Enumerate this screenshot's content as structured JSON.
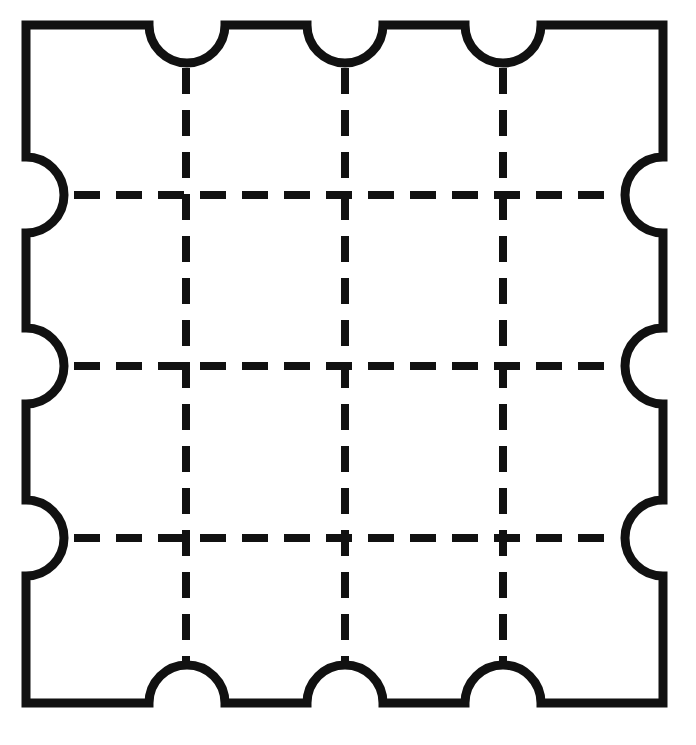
{
  "figure": {
    "title": "Square puzzle tile outline with notched edges and dashed grid",
    "caption": "",
    "background_color": "#ffffff",
    "ink_color": "#111111",
    "canvas": {
      "width": 696,
      "height": 745
    }
  },
  "outline": {
    "name": "puzzle-tile-outline",
    "shape": "square",
    "stroke_color": "#111111",
    "stroke_width": 9,
    "fill": "none",
    "bounds": {
      "left": 26,
      "top": 25,
      "right": 663,
      "bottom": 703
    },
    "corner_radius": 0,
    "notch": {
      "style": "semicircle",
      "radius": 38,
      "direction": "inward",
      "count_per_edge": 3,
      "total_count": 12
    },
    "notch_centers": {
      "top": [
        187,
        345,
        503
      ],
      "bottom": [
        187,
        345,
        503
      ],
      "left": [
        195,
        366,
        538
      ],
      "right": [
        195,
        366,
        538
      ]
    }
  },
  "grid": {
    "name": "dashed-grid",
    "stroke_color": "#111111",
    "stroke_width": 8,
    "dash_length": 26,
    "dash_gap": 16,
    "cells": "4 x 4",
    "vertical_lines": {
      "count": 3,
      "x_positions": [
        186,
        345,
        503
      ],
      "y_start": 68,
      "y_end": 662
    },
    "horizontal_lines": {
      "count": 3,
      "y_positions": [
        195,
        366,
        538
      ],
      "x_start": 74,
      "x_end": 618
    }
  },
  "labels": {
    "figure_label": "",
    "annotations": []
  }
}
